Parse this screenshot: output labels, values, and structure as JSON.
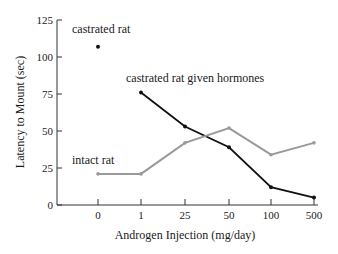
{
  "chart_data": {
    "type": "line",
    "title": "",
    "xlabel": "Androgen Injection (mg/day)",
    "ylabel": "Latency to Mount (sec)",
    "categories": [
      "0",
      "1",
      "25",
      "50",
      "100",
      "500"
    ],
    "ylim": [
      0,
      125
    ],
    "yticks": [
      "0",
      "25",
      "50",
      "75",
      "100",
      "125"
    ],
    "grid": false,
    "legend": "inline labels",
    "series": [
      {
        "name": "castrated rat",
        "color": "#111111",
        "style": "point",
        "values": [
          107,
          null,
          null,
          null,
          null,
          null
        ]
      },
      {
        "name": "castrated rat given hormones",
        "color": "#111111",
        "style": "line",
        "values": [
          null,
          76,
          53,
          39,
          12,
          5
        ]
      },
      {
        "name": "intact rat",
        "color": "#9a9a9a",
        "style": "line",
        "values": [
          21,
          21,
          42,
          52,
          34,
          42
        ]
      }
    ],
    "annotations": [
      {
        "text": "castrated rat",
        "series": 0
      },
      {
        "text": "castrated rat given hormones",
        "series": 1
      },
      {
        "text": "intact rat",
        "series": 2
      }
    ]
  }
}
